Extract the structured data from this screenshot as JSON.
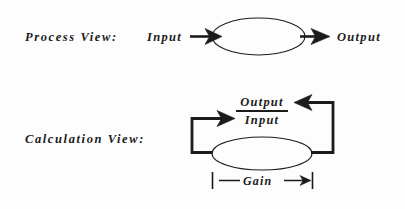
{
  "diagram": {
    "title_present": false,
    "background_color": "#fdfdfd",
    "stroke_color": "#1b1b1b",
    "rows": [
      {
        "id": "process-view",
        "label": "Process View:",
        "input_label": "Input",
        "output_label": "Output"
      },
      {
        "id": "calculation-view",
        "label": "Calculation View:",
        "fraction": {
          "numerator": "Output",
          "denominator": "Input"
        },
        "measure_label": "Gain"
      }
    ]
  },
  "process_view": {
    "row_label": "Process View:",
    "input_label": "Input",
    "output_label": "Output",
    "shape": "ellipse"
  },
  "calculation_view": {
    "row_label": "Calculation View:",
    "ratio_numerator": "Output",
    "ratio_denominator": "Input",
    "gain_label": "Gain",
    "shape": "ellipse"
  }
}
